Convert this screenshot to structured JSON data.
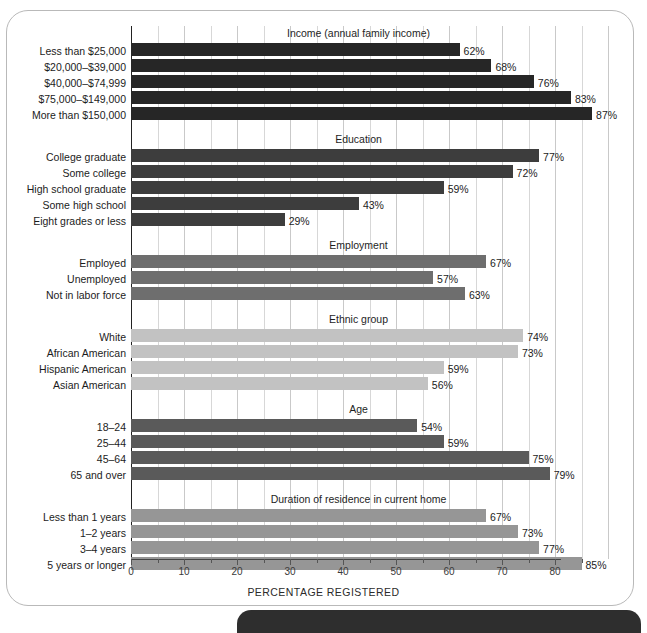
{
  "chart_data": {
    "type": "bar",
    "orientation": "horizontal",
    "title": "",
    "xlabel": "PERCENTAGE REGISTERED",
    "ylabel": "",
    "xlim": [
      0,
      90
    ],
    "xticks": [
      0,
      10,
      20,
      30,
      40,
      50,
      60,
      70,
      80
    ],
    "xtick_labels": [
      "0",
      "10",
      "20",
      "30",
      "40",
      "50",
      "60",
      "70",
      "80"
    ],
    "minor_tick_step": 5,
    "grid": "vertical",
    "legend": "none",
    "value_suffix": "%",
    "groups": [
      {
        "name": "Income (annual family income)",
        "color": "#262626",
        "categories": [
          "Less than $25,000",
          "$20,000–$39,000",
          "$40,000–$74,999",
          "$75,000–$149,000",
          "More than $150,000"
        ],
        "values": [
          62,
          68,
          76,
          83,
          87
        ],
        "labels": [
          "62%",
          "68%",
          "76%",
          "83%",
          "87%"
        ]
      },
      {
        "name": "Education",
        "color": "#3d3d3d",
        "categories": [
          "College graduate",
          "Some college",
          "High school graduate",
          "Some high school",
          "Eight grades or less"
        ],
        "values": [
          77,
          72,
          59,
          43,
          29
        ],
        "labels": [
          "77%",
          "72%",
          "59%",
          "43%",
          "29%"
        ]
      },
      {
        "name": "Employment",
        "color": "#6e6e6e",
        "categories": [
          "Employed",
          "Unemployed",
          "Not in labor force"
        ],
        "values": [
          67,
          57,
          63
        ],
        "labels": [
          "67%",
          "57%",
          "63%"
        ]
      },
      {
        "name": "Ethnic group",
        "color": "#c2c2c2",
        "categories": [
          "White",
          "African American",
          "Hispanic American",
          "Asian American"
        ],
        "values": [
          74,
          73,
          59,
          56
        ],
        "labels": [
          "74%",
          "73%",
          "59%",
          "56%"
        ]
      },
      {
        "name": "Age",
        "color": "#5a5a5a",
        "categories": [
          "18–24",
          "25–44",
          "45–64",
          "65 and over"
        ],
        "values": [
          54,
          59,
          75,
          79
        ],
        "labels": [
          "54%",
          "59%",
          "75%",
          "79%"
        ]
      },
      {
        "name": "Duration of residence in current home",
        "color": "#969696",
        "categories": [
          "Less than 1 years",
          "1–2 years",
          "3–4 years",
          "5 years or longer"
        ],
        "values": [
          67,
          73,
          77,
          85
        ],
        "labels": [
          "67%",
          "73%",
          "77%",
          "85%"
        ]
      }
    ]
  }
}
